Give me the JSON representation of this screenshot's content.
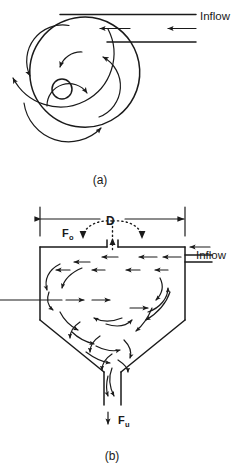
{
  "figure": {
    "panels": [
      {
        "id": "panel-a",
        "caption": "(a)",
        "view": "plan",
        "inflow_label": "Inflow",
        "description": "spiral-flow-plan-view"
      },
      {
        "id": "panel-b",
        "caption": "(b)",
        "view": "elevation",
        "inflow_label": "Inflow",
        "diameter_label": "D",
        "overflow_symbol": "F",
        "overflow_subscript": "o",
        "underflow_symbol": "F",
        "underflow_subscript": "u"
      }
    ]
  },
  "colors": {
    "ink": "#1a1a1a",
    "background": "#ffffff"
  },
  "icons": {
    "arrow_left": "arrow-left-icon",
    "arrow_down": "arrow-down-icon",
    "arrow_up": "arrow-up-icon",
    "dimension_arrow": "dimension-arrow-icon"
  }
}
